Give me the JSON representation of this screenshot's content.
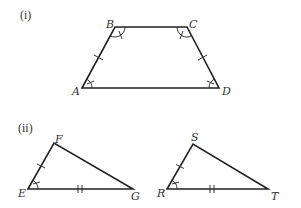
{
  "figures": [
    {
      "section_label": "(i)",
      "shape": "isosceles-trapezoid",
      "vertices": {
        "A": {
          "label": "A",
          "x": 82,
          "y": 88
        },
        "B": {
          "label": "B",
          "x": 115,
          "y": 27
        },
        "C": {
          "label": "C",
          "x": 187,
          "y": 27
        },
        "D": {
          "label": "D",
          "x": 219,
          "y": 88
        }
      },
      "marks": {
        "equal_sides_single_tick": [
          "AB",
          "CD"
        ],
        "equal_angles_pair_1": [
          "B",
          "C"
        ],
        "equal_angles_pair_2": [
          "A",
          "D"
        ]
      }
    },
    {
      "section_label": "(ii)",
      "shape": "triangle",
      "vertices": {
        "E": {
          "label": "E",
          "x": 28,
          "y": 189
        },
        "F": {
          "label": "F",
          "x": 54,
          "y": 143
        },
        "G": {
          "label": "G",
          "x": 133,
          "y": 189
        }
      },
      "marks": {
        "single_tick_side": "EF",
        "double_tick_side": "EG",
        "angle_mark": "E"
      }
    },
    {
      "section_label": "",
      "shape": "triangle",
      "vertices": {
        "R": {
          "label": "R",
          "x": 167,
          "y": 189
        },
        "S": {
          "label": "S",
          "x": 193,
          "y": 144
        },
        "T": {
          "label": "T",
          "x": 268,
          "y": 189
        }
      },
      "marks": {
        "single_tick_side": "RS",
        "double_tick_side": "RT",
        "angle_mark": "R"
      }
    }
  ],
  "labels": {
    "section_i": "(i)",
    "section_ii": "(ii)",
    "A": "A",
    "B": "B",
    "C": "C",
    "D": "D",
    "E": "E",
    "F": "F",
    "G": "G",
    "R": "R",
    "S": "S",
    "T": "T"
  }
}
